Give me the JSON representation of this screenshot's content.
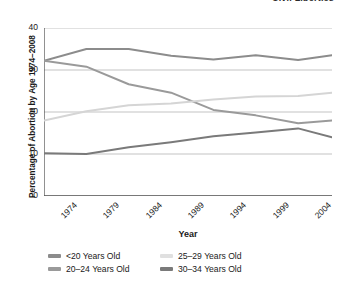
{
  "header": {
    "title": "Civil Liberties"
  },
  "axis": {
    "y_title": "Percentage of Abortion by Age 1974–2008",
    "x_title": "Year"
  },
  "chart_data": {
    "type": "line",
    "title": "",
    "xlabel": "Year",
    "ylabel": "Percentage of Abortion by Age 1974–2008",
    "x": [
      1974,
      1979,
      1984,
      1989,
      1994,
      1999,
      2004,
      2008
    ],
    "categories": [
      "1974",
      "1979",
      "1984",
      "1989",
      "1994",
      "1999",
      "2004",
      "2008"
    ],
    "xlim": [
      1974,
      2008
    ],
    "ylim": [
      0,
      40
    ],
    "yticks": [
      0,
      10,
      20,
      30,
      40
    ],
    "grid": true,
    "legend_position": "bottom",
    "series": [
      {
        "name": "<20 Years Old",
        "color": "#8c8c8c",
        "values": [
          32.2,
          35.0,
          35.0,
          33.4,
          32.5,
          33.5,
          32.4,
          33.5
        ]
      },
      {
        "name": "20–24 Years Old",
        "color": "#9a9a9a",
        "values": [
          32.2,
          30.8,
          26.6,
          24.6,
          20.5,
          19.2,
          17.3,
          18.0
        ]
      },
      {
        "name": "25–29 Years Old",
        "color": "#d5d5d5",
        "values": [
          18.0,
          20.2,
          21.6,
          22.0,
          23.0,
          23.7,
          23.8,
          24.6
        ]
      },
      {
        "name": "30–34 Years Old",
        "color": "#7a7a7a",
        "values": [
          10.2,
          10.0,
          11.6,
          12.8,
          14.2,
          15.1,
          16.1,
          14.0
        ]
      }
    ]
  },
  "legend": {
    "items": [
      {
        "label": "<20 Years Old",
        "color": "#8c8c8c"
      },
      {
        "label": "25–29 Years Old",
        "color": "#e0e0e0"
      },
      {
        "label": "20–24 Years Old",
        "color": "#9a9a9a"
      },
      {
        "label": "30–34 Years Old",
        "color": "#7a7a7a"
      }
    ]
  },
  "colors": {
    "axis": "#555555",
    "grid": "#aaaaaa",
    "text": "#1a1a1a",
    "background": "#ffffff"
  }
}
